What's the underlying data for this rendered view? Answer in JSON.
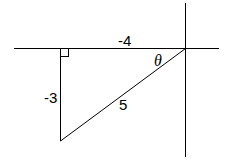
{
  "diagram": {
    "type": "right-triangle-on-axes",
    "labels": {
      "horizontal_leg": "-4",
      "vertical_leg": "-3",
      "hypotenuse": "5",
      "angle": "θ"
    },
    "colors": {
      "stroke": "#000000",
      "background": "#ffffff"
    }
  }
}
